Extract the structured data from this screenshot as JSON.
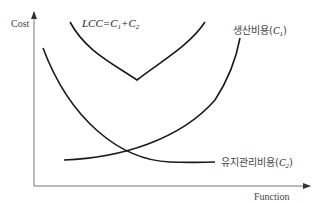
{
  "axes": {
    "y_label": "Cost",
    "x_label": "Function"
  },
  "curves": {
    "lcc": {
      "label": "LCC=C",
      "sub1": "1",
      "plus": "+C",
      "sub2": "2"
    },
    "production": {
      "label": "생산비용(",
      "var": "C",
      "sub": "1",
      "close": ")"
    },
    "maintenance": {
      "label": "유지관리비용(",
      "var": "C",
      "sub": "2",
      "close": ")"
    }
  },
  "colors": {
    "curve": "#1a1a1a",
    "axis": "#777777"
  }
}
